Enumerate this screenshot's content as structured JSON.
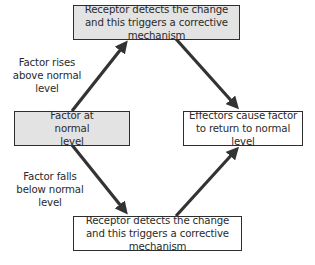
{
  "diagram": {
    "nodes": {
      "top": {
        "text": "Receptor detects the change and this triggers a corrective mechanism",
        "fill": "#e3e3e3"
      },
      "left": {
        "text": "Factor at normal level",
        "fill": "#e3e3e3"
      },
      "right": {
        "text": "Effectors cause factor to return to normal level",
        "fill": "#ffffff"
      },
      "bottom": {
        "text": "Receptor detects the change and this triggers a corrective mechanism",
        "fill": "#ffffff"
      }
    },
    "labels": {
      "rises": "Factor rises above normal level",
      "falls": "Factor falls below normal level"
    },
    "edges": [
      {
        "from": "left",
        "to": "top",
        "label": "Factor rises above normal level"
      },
      {
        "from": "top",
        "to": "right",
        "label": ""
      },
      {
        "from": "left",
        "to": "bottom",
        "label": "Factor falls below normal level"
      },
      {
        "from": "bottom",
        "to": "right",
        "label": ""
      }
    ],
    "arrow_color": "#333333",
    "border_color": "#2e2e2e"
  }
}
